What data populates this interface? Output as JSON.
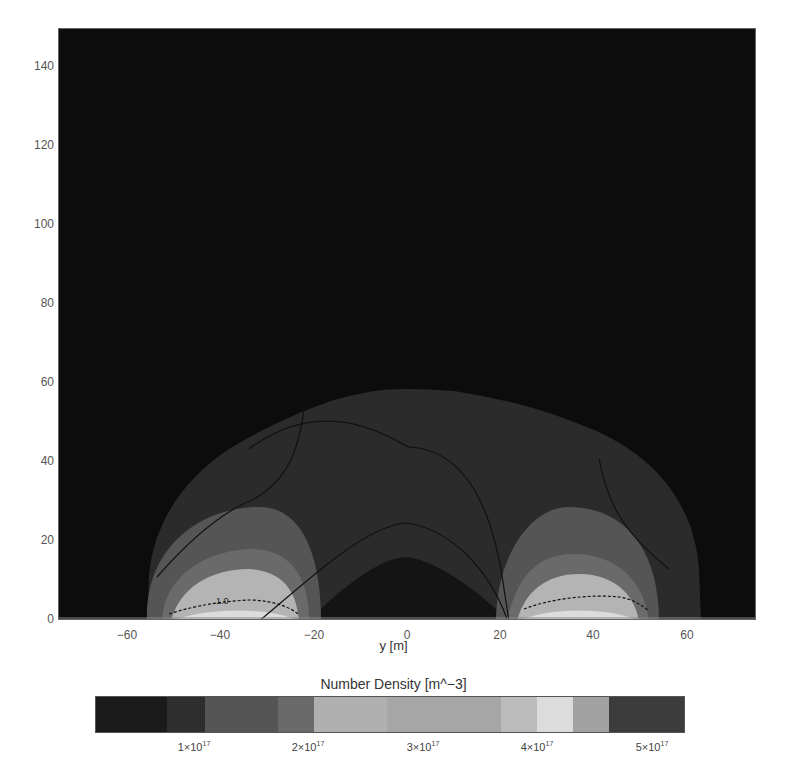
{
  "chart_data": {
    "type": "heatmap",
    "subtype": "filled-contour",
    "title": "",
    "xlabel": "y [m]",
    "ylabel": "",
    "xlim": [
      -75,
      75
    ],
    "ylim": [
      0,
      150
    ],
    "xticks": [
      -60,
      -40,
      -20,
      0,
      20,
      40,
      60
    ],
    "xtick_labels": [
      "−60",
      "−40",
      "−20",
      "0",
      "20",
      "40",
      "60"
    ],
    "yticks": [
      0,
      20,
      40,
      60,
      80,
      100,
      120,
      140
    ],
    "ytick_labels": [
      "0",
      "20",
      "40",
      "60",
      "80",
      "100",
      "120",
      "140"
    ],
    "colorbar": {
      "title": "Number Density [m^−3]",
      "range": [
        0,
        5.5e+17
      ],
      "ticks": [
        1e+17,
        2e+17,
        3e+17,
        4e+17,
        5e+17
      ],
      "tick_labels": [
        {
          "mant": "1×10",
          "exp": "17"
        },
        {
          "mant": "2×10",
          "exp": "17"
        },
        {
          "mant": "3×10",
          "exp": "17"
        },
        {
          "mant": "4×10",
          "exp": "17"
        },
        {
          "mant": "5×10",
          "exp": "17"
        }
      ],
      "segments": [
        {
          "from": 0.0,
          "to": 0.12,
          "color": "#1a1a1a"
        },
        {
          "from": 0.12,
          "to": 0.185,
          "color": "#2e2e2e"
        },
        {
          "from": 0.185,
          "to": 0.31,
          "color": "#555555"
        },
        {
          "from": 0.31,
          "to": 0.37,
          "color": "#6a6a6a"
        },
        {
          "from": 0.37,
          "to": 0.495,
          "color": "#b0b0b0"
        },
        {
          "from": 0.495,
          "to": 0.688,
          "color": "#a6a6a6"
        },
        {
          "from": 0.688,
          "to": 0.75,
          "color": "#bcbcbc"
        },
        {
          "from": 0.75,
          "to": 0.812,
          "color": "#dcdcdc"
        },
        {
          "from": 0.812,
          "to": 0.873,
          "color": "#a2a2a2"
        },
        {
          "from": 0.873,
          "to": 1.0,
          "color": "#3c3c3c"
        }
      ]
    },
    "regions": [
      {
        "name": "outer-envelope",
        "extent_x": [
          -66,
          70
        ],
        "max_height": 57,
        "level_color": "#2e2e2e"
      },
      {
        "name": "left-lobe-mid",
        "center_x": -38,
        "max_height": 30,
        "level_color": "#555555"
      },
      {
        "name": "left-lobe-inner",
        "center_x": -38,
        "max_height": 18,
        "level_color": "#6a6a6a"
      },
      {
        "name": "left-lobe-core",
        "center_x": -38,
        "max_height": 12,
        "level_color": "#b0b0b0"
      },
      {
        "name": "right-lobe-mid",
        "center_x": 38,
        "max_height": 29,
        "level_color": "#555555"
      },
      {
        "name": "right-lobe-inner",
        "center_x": 38,
        "max_height": 17,
        "level_color": "#6a6a6a"
      },
      {
        "name": "right-lobe-core",
        "center_x": 38,
        "max_height": 12,
        "level_color": "#b0b0b0"
      },
      {
        "name": "central-low-dome",
        "extent_x": [
          -28,
          28
        ],
        "max_height": 16,
        "level_color": "#161616"
      }
    ],
    "contour_lines": [
      {
        "label": "1.0",
        "position": [
          -40,
          5
        ]
      },
      {
        "label": "",
        "description": "arch centered at 0 peaking near y=44"
      },
      {
        "label": "",
        "description": "arch centered at 0 peaking near y=22"
      },
      {
        "label": "",
        "description": "lines from upper envelope down into lobes on each side"
      }
    ],
    "grid": false,
    "legend": "colorbar-below"
  }
}
